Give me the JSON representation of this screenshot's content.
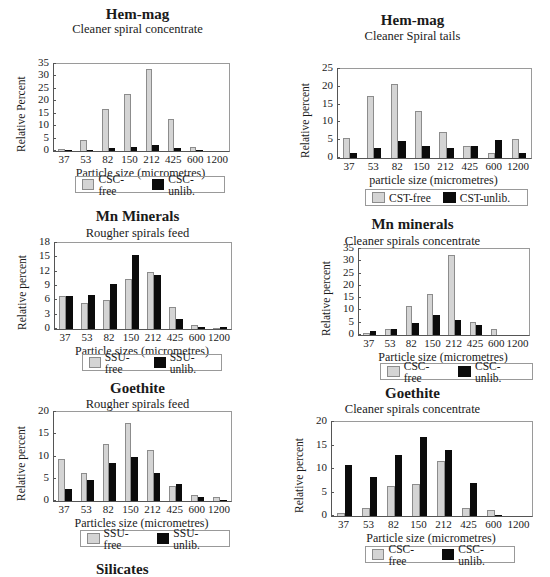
{
  "chart_data": [
    {
      "type": "bar",
      "title": "Hem-mag",
      "subtitle": "Cleaner spiral concentrate",
      "xlabel": "Particle size (micrometres)",
      "ylabel": "Relative Percent",
      "categories": [
        "37",
        "53",
        "82",
        "150",
        "212",
        "425",
        "600",
        "1200"
      ],
      "yticks": [
        "0",
        "5",
        "10",
        "15",
        "20",
        "25",
        "30",
        "35"
      ],
      "ylim": [
        0,
        35
      ],
      "series": [
        {
          "name": "CSC-free",
          "values": [
            0.7,
            4.3,
            17,
            23,
            33,
            12.8,
            1.5,
            0
          ]
        },
        {
          "name": "CSC-unlib.",
          "values": [
            0.4,
            0.6,
            1.2,
            1.7,
            2.4,
            1.1,
            0.3,
            0
          ]
        }
      ],
      "legend": [
        "CSC-free",
        "CSC-unlib."
      ],
      "legend_position": "bottom"
    },
    {
      "type": "bar",
      "title": "Hem-mag",
      "subtitle": "Cleaner Spiral tails",
      "xlabel": "particle size (micrometres)",
      "ylabel": "Relative percent",
      "categories": [
        "37",
        "53",
        "82",
        "150",
        "212",
        "425",
        "600",
        "1200"
      ],
      "yticks": [
        "0",
        "5",
        "10",
        "15",
        "20",
        "25"
      ],
      "ylim": [
        0,
        25
      ],
      "series": [
        {
          "name": "CST-free",
          "values": [
            5.6,
            17.3,
            20.8,
            13.3,
            7.4,
            3.4,
            1.5,
            5.3
          ]
        },
        {
          "name": "CST-unlib.",
          "values": [
            1.5,
            2.9,
            4.7,
            3.3,
            2.7,
            3.4,
            5.2,
            1.5
          ]
        }
      ],
      "legend": [
        "CST-free",
        "CST-unlib."
      ],
      "legend_position": "bottom"
    },
    {
      "type": "bar",
      "title": "Mn Minerals",
      "subtitle": "Rougher spirals feed",
      "xlabel": "Particle sizes (micrometres)",
      "ylabel": "Relative percent",
      "categories": [
        "37",
        "53",
        "82",
        "150",
        "212",
        "425",
        "600",
        "1200"
      ],
      "yticks": [
        "0",
        "3",
        "6",
        "9",
        "12",
        "15",
        "18"
      ],
      "ylim": [
        0,
        18
      ],
      "series": [
        {
          "name": "SSU-free",
          "values": [
            7.0,
            5.4,
            6.0,
            10.4,
            12.0,
            4.6,
            0.8,
            0.1
          ]
        },
        {
          "name": "SSU-unlib.",
          "values": [
            7.0,
            7.2,
            9.5,
            15.4,
            11.4,
            2.2,
            0.4,
            0.5
          ]
        }
      ],
      "legend": [
        "SSU-free",
        "SSU-unlib."
      ],
      "legend_position": "bottom"
    },
    {
      "type": "bar",
      "title": "Mn minerals",
      "subtitle": "Cleaner spirals concentrate",
      "xlabel": "Particle size (micrometres)",
      "ylabel": "Relative percent",
      "categories": [
        "37",
        "53",
        "82",
        "150",
        "212",
        "425",
        "600",
        "1200"
      ],
      "yticks": [
        "0",
        "5",
        "10",
        "15",
        "20",
        "25",
        "30",
        "35"
      ],
      "ylim": [
        0,
        35
      ],
      "series": [
        {
          "name": "CSC-free",
          "values": [
            0.8,
            2.3,
            12,
            16.8,
            32.5,
            5.4,
            2.3,
            0
          ]
        },
        {
          "name": "CSC-unlib.",
          "values": [
            1.8,
            2.6,
            4.7,
            8.3,
            6.2,
            3.9,
            0,
            0
          ]
        }
      ],
      "legend": [
        "CSC-free",
        "CSC-unlib."
      ],
      "legend_position": "bottom"
    },
    {
      "type": "bar",
      "title": "Goethite",
      "subtitle": "Rougher spirals feed",
      "xlabel": "Particles size (micrometres)",
      "ylabel": "Relative percent",
      "categories": [
        "37",
        "53",
        "82",
        "150",
        "212",
        "425",
        "600",
        "1200"
      ],
      "yticks": [
        "0",
        "5",
        "10",
        "15",
        "20"
      ],
      "ylim": [
        0,
        20
      ],
      "series": [
        {
          "name": "SSU-free",
          "values": [
            9.4,
            6.3,
            12.8,
            17.6,
            11.4,
            3.3,
            1.3,
            0.8
          ]
        },
        {
          "name": "SSU-unlib.",
          "values": [
            2.7,
            4.8,
            8.6,
            9.8,
            6.2,
            3.8,
            0.8,
            0.2
          ]
        }
      ],
      "legend": [
        "SSU-free",
        "SSU-unlib."
      ],
      "legend_position": "bottom"
    },
    {
      "type": "bar",
      "title": "Goethite",
      "subtitle": "Cleaner spirals concentrate",
      "xlabel": "Particle size (micrometres)",
      "ylabel": "Relative percent",
      "categories": [
        "37",
        "53",
        "82",
        "150",
        "212",
        "425",
        "600",
        "1200"
      ],
      "yticks": [
        "0",
        "5",
        "10",
        "15",
        "20"
      ],
      "ylim": [
        0,
        20
      ],
      "series": [
        {
          "name": "CSC-free",
          "values": [
            0.6,
            1.7,
            6.4,
            6.8,
            11.6,
            1.6,
            1.2,
            0
          ]
        },
        {
          "name": "CSC-unlib.",
          "values": [
            10.9,
            8.3,
            13.0,
            16.8,
            14.1,
            7.1,
            0.1,
            0
          ]
        }
      ],
      "legend": [
        "CSC-free",
        "CSC-unlib."
      ],
      "legend_position": "bottom"
    }
  ],
  "partial_title": "Silicates",
  "colors": {
    "free": "#d4d4d4",
    "unlib": "#0b0b0b",
    "axis": "#555555"
  }
}
